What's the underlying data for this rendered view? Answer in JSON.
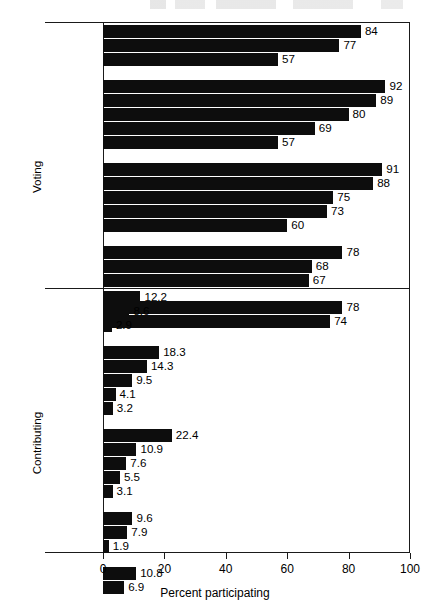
{
  "chart_data": {
    "type": "bar",
    "orientation": "horizontal",
    "title": "",
    "xlabel": "Percent participating",
    "ylabel": "",
    "xlim": [
      0,
      100
    ],
    "xticks": [
      0,
      20,
      40,
      60,
      80,
      100
    ],
    "grid": false,
    "legend": null,
    "panels": [
      {
        "name": "Voting",
        "groups": [
          {
            "name": "age",
            "categories": [
              "65+",
              "35-64",
              "18-34"
            ],
            "values": [
              84,
              77,
              57
            ]
          },
          {
            "name": "education",
            "categories": [
              "Post Grad",
              "Coll Grad",
              "Some Coll",
              "HS Grad",
              "< HS"
            ],
            "values": [
              92,
              89,
              80,
              69,
              57
            ]
          },
          {
            "name": "income",
            "categories": [
              "$75K+",
              "$50-74K",
              "$30-49K",
              "$15-29K",
              "< $15K"
            ],
            "values": [
              91,
              88,
              75,
              73,
              60
            ]
          },
          {
            "name": "race",
            "categories": [
              "White",
              "Hispanic",
              "Black"
            ],
            "values": [
              78,
              68,
              67
            ]
          },
          {
            "name": "gender",
            "categories": [
              "Men",
              "Women"
            ],
            "values": [
              78,
              74
            ]
          }
        ]
      },
      {
        "name": "Contributing",
        "groups": [
          {
            "name": "age",
            "categories": [
              "65+",
              "35-64",
              "18-34"
            ],
            "values": [
              12.2,
              8.6,
              2.9
            ]
          },
          {
            "name": "education",
            "categories": [
              "Post Grad",
              "Coll Grad",
              "Some Coll",
              "HS Grad",
              "< HS"
            ],
            "values": [
              18.3,
              14.3,
              9.5,
              4.1,
              3.2
            ]
          },
          {
            "name": "income",
            "categories": [
              "$75K+",
              "$50-74K",
              "$30-49K",
              "$15-29K",
              "< $15K"
            ],
            "values": [
              22.4,
              10.9,
              7.6,
              5.5,
              3.1
            ]
          },
          {
            "name": "race",
            "categories": [
              "White",
              "Hispanic",
              "Black"
            ],
            "values": [
              9.6,
              7.9,
              1.9
            ]
          },
          {
            "name": "gender",
            "categories": [
              "Men",
              "Women"
            ],
            "values": [
              10.8,
              6.9
            ]
          }
        ]
      }
    ],
    "bar_color": "#0d0d0d",
    "axis_color": "#1a1a1a"
  }
}
